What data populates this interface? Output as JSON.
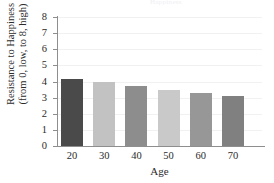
{
  "figure": {
    "title_remnant": "Happiness",
    "background": "#ffffff"
  },
  "axes": {
    "ylabel_line1": "Resistance to Happiness",
    "ylabel_line2": "(from 0, low, to 8, high)",
    "xlabel": "Age",
    "ytick_labels": [
      "8",
      "7",
      "6",
      "5",
      "4",
      "3",
      "2",
      "1",
      "0"
    ],
    "xtick_labels": [
      "20",
      "30",
      "40",
      "50",
      "60",
      "70"
    ],
    "axis_color": "#8e8e90",
    "grid_color": "#f1f1f4"
  },
  "chart_data": {
    "type": "bar",
    "title": "",
    "categories": [
      "20",
      "30",
      "40",
      "50",
      "60",
      "70"
    ],
    "values": [
      4.15,
      3.95,
      3.75,
      3.5,
      3.3,
      3.1
    ],
    "colors": [
      "#4a4a4a",
      "#c2c2c2",
      "#8d8d8d",
      "#c9c9c9",
      "#979797",
      "#808080"
    ],
    "xlabel": "Age",
    "ylabel": "Resistance to Happiness (from 0, low, to 8, high)",
    "ylim": [
      0,
      8
    ],
    "ytick_step": 1,
    "grid": true,
    "grid_axis": "y",
    "legend": false
  }
}
